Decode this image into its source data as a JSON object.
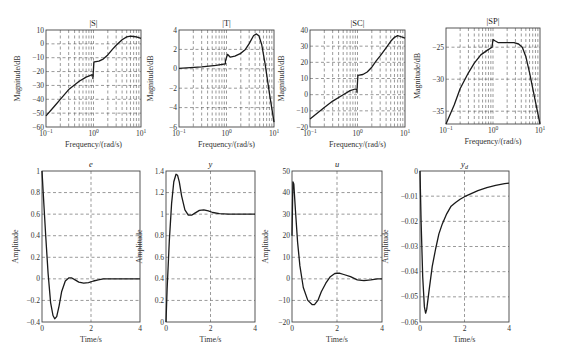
{
  "chart_data": [
    {
      "id": "S",
      "type": "line",
      "title": "|S|",
      "xlabel": "Frequency/(rad/s)",
      "ylabel": "Magnitude/dB",
      "xscale": "log",
      "xlim": [
        0.1,
        10
      ],
      "ylim": [
        -60,
        10
      ],
      "xticks": [
        0.1,
        1,
        10
      ],
      "xtick_labels": [
        "10^-1",
        "10^0",
        "10^1"
      ],
      "yticks": [
        10,
        0,
        -10,
        -20,
        -30,
        -40,
        -50,
        -60
      ],
      "grid": true,
      "x": [
        0.1,
        0.15,
        0.2,
        0.3,
        0.5,
        0.7,
        0.9,
        0.97,
        0.97,
        1.02,
        1.05,
        1.3,
        1.6,
        2.0,
        2.5,
        3.0,
        4.0,
        5.0,
        6.0,
        7.0,
        8.0,
        10.0
      ],
      "y": [
        -52,
        -45,
        -40,
        -33,
        -27,
        -24,
        -22.5,
        -22.5,
        -25,
        -13,
        -13,
        -12.5,
        -11,
        -8,
        -4,
        -1,
        3,
        5,
        5.5,
        5.3,
        5,
        4
      ]
    },
    {
      "id": "T",
      "type": "line",
      "title": "|T|",
      "xlabel": "Frequency/(rad/s)",
      "ylabel": "Magnitude/dB",
      "xscale": "log",
      "xlim": [
        0.1,
        10
      ],
      "ylim": [
        -6,
        4
      ],
      "xticks": [
        0.1,
        1,
        10
      ],
      "xtick_labels": [
        "10^-1",
        "10^0",
        "10^1"
      ],
      "yticks": [
        4,
        2,
        0,
        -2,
        -4,
        -6
      ],
      "grid": true,
      "x": [
        0.1,
        0.3,
        0.6,
        0.95,
        0.95,
        1.05,
        1.2,
        1.5,
        2.0,
        2.5,
        3.0,
        3.7,
        4.2,
        4.8,
        5.5,
        6.5,
        8.0,
        10.0
      ],
      "y": [
        0.05,
        0.2,
        0.35,
        0.5,
        0.8,
        1.5,
        1.2,
        1.3,
        1.6,
        2.0,
        2.6,
        3.4,
        3.6,
        3.4,
        2.5,
        0.5,
        -2.5,
        -5.5
      ]
    },
    {
      "id": "SC",
      "type": "line",
      "title": "|SC|",
      "xlabel": "Frequency/(rad/s)",
      "ylabel": "Magnitude/dB",
      "xscale": "log",
      "xlim": [
        0.1,
        10
      ],
      "ylim": [
        -20,
        40
      ],
      "xticks": [
        0.1,
        1,
        10
      ],
      "xtick_labels": [
        "10^-1",
        "10^0",
        "10^1"
      ],
      "yticks": [
        40,
        30,
        20,
        10,
        0,
        -10,
        -20
      ],
      "grid": true,
      "x": [
        0.1,
        0.2,
        0.3,
        0.5,
        0.7,
        0.9,
        0.97,
        0.97,
        1.02,
        1.3,
        1.6,
        2.0,
        2.5,
        3.0,
        4.0,
        5.0,
        6.0,
        7.0,
        8.0,
        10.0
      ],
      "y": [
        -15,
        -8,
        -4,
        0,
        2.5,
        3.5,
        3,
        1.5,
        12,
        12.5,
        14,
        17,
        21,
        24,
        29,
        33,
        35.5,
        36.5,
        36,
        35
      ]
    },
    {
      "id": "SP",
      "type": "line",
      "title": "|SP|",
      "xlabel": "Frequency/(rad/s)",
      "ylabel": "Magnitude/dB",
      "xscale": "log",
      "xlim": [
        0.1,
        10
      ],
      "ylim": [
        -37,
        -22
      ],
      "xticks": [
        0.1,
        1,
        10
      ],
      "xtick_labels": [
        "10^-1",
        "10^0",
        "10^1"
      ],
      "yticks": [
        -25,
        -30,
        -35
      ],
      "grid": true,
      "x": [
        0.1,
        0.15,
        0.2,
        0.3,
        0.4,
        0.55,
        0.75,
        0.95,
        1.0,
        1.1,
        1.3,
        1.6,
        2.0,
        2.8,
        3.5,
        4.2,
        5.0,
        6.0,
        7.5,
        10.0
      ],
      "y": [
        -37,
        -34,
        -31.5,
        -29,
        -27.5,
        -26.2,
        -25.5,
        -25,
        -23.8,
        -24,
        -24.3,
        -24.3,
        -24.3,
        -24.3,
        -24.5,
        -25,
        -26.5,
        -29,
        -32.5,
        -37
      ]
    },
    {
      "id": "e",
      "type": "line",
      "title": "e",
      "xlabel": "Time/s",
      "ylabel": "Amplitude",
      "xlim": [
        0,
        4
      ],
      "ylim": [
        -0.4,
        1
      ],
      "xticks": [
        0,
        2,
        4
      ],
      "yticks": [
        1,
        0.8,
        0.6,
        0.4,
        0.2,
        0,
        -0.2,
        -0.4
      ],
      "ytick_labels": [
        "1",
        "0.8",
        "0.6",
        "0.4",
        "0.2",
        "0",
        "-0.2",
        "-0.4"
      ],
      "grid": true,
      "x": [
        0,
        0.05,
        0.15,
        0.25,
        0.35,
        0.45,
        0.52,
        0.6,
        0.7,
        0.8,
        0.95,
        1.1,
        1.2,
        1.35,
        1.5,
        1.7,
        1.9,
        2.1,
        2.3,
        2.5,
        3.0,
        3.5,
        4.0
      ],
      "y": [
        1,
        0.8,
        0.4,
        0.05,
        -0.22,
        -0.34,
        -0.37,
        -0.35,
        -0.25,
        -0.12,
        -0.02,
        0.01,
        0.01,
        -0.01,
        -0.03,
        -0.04,
        -0.035,
        -0.02,
        -0.01,
        0,
        0,
        0,
        0
      ]
    },
    {
      "id": "y",
      "type": "line",
      "title": "y",
      "xlabel": "Time/s",
      "ylabel": "Amplitude",
      "xlim": [
        0,
        4
      ],
      "ylim": [
        0,
        1.4
      ],
      "xticks": [
        0,
        2,
        4
      ],
      "yticks": [
        1.4,
        1.2,
        1,
        0.8,
        0.6,
        0.4,
        0.2,
        0
      ],
      "ytick_labels": [
        "1.4",
        "1.2",
        "1",
        "0.8",
        "0.6",
        "0.4",
        "0.2",
        "0"
      ],
      "grid": true,
      "x": [
        0,
        0.05,
        0.15,
        0.25,
        0.35,
        0.45,
        0.52,
        0.6,
        0.7,
        0.85,
        1.0,
        1.15,
        1.3,
        1.5,
        1.7,
        1.9,
        2.1,
        2.4,
        2.8,
        3.2,
        4.0
      ],
      "y": [
        0,
        0.3,
        0.75,
        1.1,
        1.3,
        1.37,
        1.36,
        1.3,
        1.17,
        1.04,
        0.99,
        0.99,
        1.01,
        1.035,
        1.04,
        1.03,
        1.015,
        1.005,
        1.0,
        1.0,
        1.0
      ]
    },
    {
      "id": "u",
      "type": "line",
      "title": "u",
      "xlabel": "Time/s",
      "ylabel": "Amplitude",
      "xlim": [
        0,
        4
      ],
      "ylim": [
        -20,
        50
      ],
      "xticks": [
        0,
        2,
        4
      ],
      "yticks": [
        50,
        40,
        30,
        20,
        10,
        0,
        -10,
        -20
      ],
      "grid": true,
      "x": [
        0,
        0.04,
        0.08,
        0.15,
        0.25,
        0.35,
        0.5,
        0.7,
        0.9,
        1.0,
        1.15,
        1.3,
        1.5,
        1.7,
        1.9,
        2.1,
        2.3,
        2.6,
        2.9,
        3.2,
        3.5,
        3.8,
        4.0
      ],
      "y": [
        20,
        45,
        44,
        32,
        17,
        6,
        -4,
        -10,
        -12,
        -12,
        -10,
        -6,
        -2,
        1,
        2.5,
        2.6,
        2,
        1,
        -0.5,
        -0.8,
        -0.5,
        0,
        0
      ]
    },
    {
      "id": "yd",
      "type": "line",
      "title": "y_d",
      "xlabel": "Time/s",
      "ylabel": "Amplitude",
      "xlim": [
        0,
        4
      ],
      "ylim": [
        -0.06,
        0
      ],
      "xticks": [
        0,
        2,
        4
      ],
      "yticks": [
        0,
        -0.01,
        -0.02,
        -0.03,
        -0.04,
        -0.05,
        -0.06
      ],
      "ytick_labels": [
        "0",
        "-0.01",
        "-0.02",
        "-0.03",
        "-0.04",
        "-0.05",
        "-0.06"
      ],
      "grid": true,
      "x": [
        0,
        0.05,
        0.12,
        0.2,
        0.25,
        0.3,
        0.4,
        0.55,
        0.7,
        0.85,
        1.0,
        1.2,
        1.4,
        1.6,
        1.8,
        2.0,
        2.3,
        2.6,
        3.0,
        3.4,
        3.8,
        4.0
      ],
      "y": [
        0,
        -0.02,
        -0.042,
        -0.054,
        -0.0565,
        -0.055,
        -0.048,
        -0.038,
        -0.031,
        -0.025,
        -0.021,
        -0.017,
        -0.014,
        -0.0125,
        -0.0112,
        -0.0102,
        -0.009,
        -0.0078,
        -0.0066,
        -0.0057,
        -0.005,
        -0.0048
      ]
    }
  ],
  "labels": {
    "freq_xlabel": "Frequency/(rad/s)",
    "mag_ylabel": "Magnitude/dB",
    "time_xlabel": "Time/s",
    "amp_ylabel": "Amplitude"
  }
}
